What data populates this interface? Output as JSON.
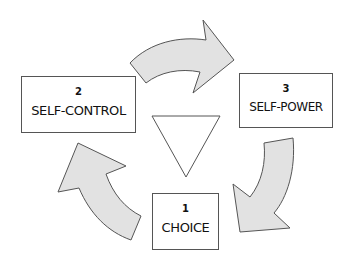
{
  "diagram": {
    "type": "cycle",
    "steps": [
      {
        "number": "1",
        "label": "CHOICE"
      },
      {
        "number": "2",
        "label": "SELF-CONTROL"
      },
      {
        "number": "3",
        "label": "SELF-POWER"
      }
    ],
    "center_shape": "downward-triangle",
    "arrows": [
      {
        "from": "2",
        "to": "3",
        "direction": "clockwise"
      },
      {
        "from": "3",
        "to": "1",
        "direction": "clockwise"
      },
      {
        "from": "1",
        "to": "2",
        "direction": "clockwise"
      }
    ],
    "colors": {
      "arrow_fill": "#e2e2e2",
      "arrow_stroke": "#555555",
      "box_border": "#555555",
      "text": "#111111"
    }
  }
}
